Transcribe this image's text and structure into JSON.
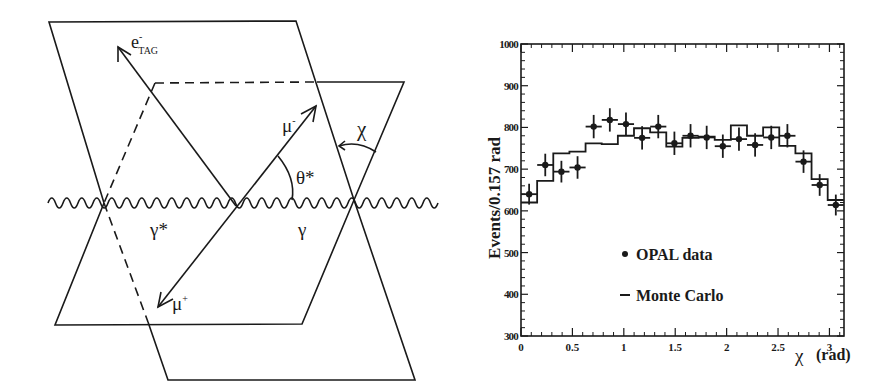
{
  "diagram": {
    "labels": {
      "e_tag": "e",
      "e_tag_sup": "-",
      "e_tag_sub": "TAG",
      "mu_minus": "μ",
      "mu_minus_sup": "-",
      "mu_plus": "μ",
      "mu_plus_sup": "+",
      "theta_star": "θ*",
      "chi": "χ",
      "gamma_star": "γ*",
      "gamma": "γ"
    }
  },
  "chart_data": {
    "type": "bar",
    "title": "",
    "xlabel": "χ",
    "xlabel_unit": "(rad)",
    "ylabel": "Events/0.157 rad",
    "xlim": [
      0,
      3.1416
    ],
    "ylim": [
      300,
      1000
    ],
    "bin_width": 0.157,
    "x_ticks": [
      "0",
      "0.5",
      "1",
      "1.5",
      "2",
      "2.5",
      "3"
    ],
    "x_tick_values": [
      0,
      0.5,
      1,
      1.5,
      2,
      2.5,
      3
    ],
    "y_ticks": [
      "300",
      "400",
      "500",
      "600",
      "700",
      "800",
      "900",
      "1000"
    ],
    "y_tick_values": [
      300,
      400,
      500,
      600,
      700,
      800,
      900,
      1000
    ],
    "grid": false,
    "legend_position": "inside-lower-left",
    "bin_centers": [
      0.079,
      0.236,
      0.393,
      0.55,
      0.707,
      0.864,
      1.021,
      1.178,
      1.335,
      1.492,
      1.649,
      1.806,
      1.963,
      2.12,
      2.277,
      2.434,
      2.591,
      2.748,
      2.905,
      3.062
    ],
    "series": [
      {
        "name": "OPAL data",
        "type": "points-with-errors",
        "values": [
          640,
          710,
          694,
          704,
          802,
          818,
          808,
          775,
          802,
          762,
          780,
          776,
          755,
          772,
          758,
          776,
          780,
          718,
          662,
          614
        ],
        "errors": [
          25,
          27,
          26,
          27,
          28,
          28,
          28,
          28,
          28,
          28,
          28,
          28,
          28,
          28,
          28,
          28,
          28,
          27,
          26,
          25
        ]
      },
      {
        "name": "Monte Carlo",
        "type": "step-histogram",
        "values": [
          620,
          672,
          738,
          742,
          762,
          760,
          780,
          798,
          788,
          754,
          775,
          778,
          770,
          805,
          780,
          800,
          756,
          738,
          676,
          626
        ]
      }
    ],
    "legend": [
      {
        "marker": "•",
        "label": "OPAL data"
      },
      {
        "marker": "–",
        "label": "Monte Carlo"
      }
    ]
  }
}
